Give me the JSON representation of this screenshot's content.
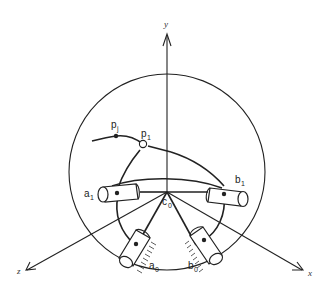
{
  "diagram": {
    "axes": {
      "x": "x",
      "y": "y",
      "z": "z"
    },
    "labels": {
      "pj": {
        "base": "p",
        "sub": "j"
      },
      "p1": {
        "base": "p",
        "sub": "1"
      },
      "a1": {
        "base": "a",
        "sub": "1"
      },
      "b1": {
        "base": "b",
        "sub": "1"
      },
      "c0": {
        "base": "c",
        "sub": "0"
      },
      "a0": {
        "base": "a",
        "sub": "0"
      },
      "b0": {
        "base": "b",
        "sub": "0"
      }
    }
  }
}
